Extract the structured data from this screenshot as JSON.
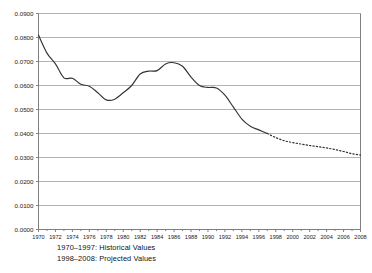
{
  "chart_data": {
    "type": "line",
    "title": "",
    "subtitle": "",
    "xlabel": "",
    "ylabel": "",
    "xlim": [
      1970,
      2008
    ],
    "ylim": [
      0.0,
      0.09
    ],
    "grid": true,
    "grid_axis": "y",
    "legend_position": "below-plot-left",
    "y_tick_labels": [
      "0.0900",
      "0.0800",
      "0.0700",
      "0.0600",
      "0.0500",
      "0.0400",
      "0.0300",
      "0.0200",
      "0.0100",
      "0.0000"
    ],
    "y_tick_values": [
      0.09,
      0.08,
      0.07,
      0.06,
      0.05,
      0.04,
      0.03,
      0.02,
      0.01,
      0.0
    ],
    "x_tick_labels": [
      "1970",
      "1972",
      "1974",
      "1976",
      "1978",
      "1980",
      "1982",
      "1984",
      "1986",
      "1988",
      "1990",
      "1992",
      "1994",
      "1996",
      "1998",
      "2000",
      "2002",
      "2004",
      "2006",
      "2008"
    ],
    "x_tick_values": [
      1970,
      1972,
      1974,
      1976,
      1978,
      1980,
      1982,
      1984,
      1986,
      1988,
      1990,
      1992,
      1994,
      1996,
      1998,
      2000,
      2002,
      2004,
      2006,
      2008
    ],
    "x": [
      1970,
      1971,
      1972,
      1973,
      1974,
      1975,
      1976,
      1977,
      1978,
      1979,
      1980,
      1981,
      1982,
      1983,
      1984,
      1985,
      1986,
      1987,
      1988,
      1989,
      1990,
      1991,
      1992,
      1993,
      1994,
      1995,
      1996,
      1997,
      1998,
      1999,
      2000,
      2001,
      2002,
      2003,
      2004,
      2005,
      2006,
      2007,
      2008
    ],
    "series": [
      {
        "name": "1970–1997: Historical Values",
        "style": "solid",
        "color": "#333333",
        "x": [
          1970,
          1971,
          1972,
          1973,
          1974,
          1975,
          1976,
          1977,
          1978,
          1979,
          1980,
          1981,
          1982,
          1983,
          1984,
          1985,
          1986,
          1987,
          1988,
          1989,
          1990,
          1991,
          1992,
          1993,
          1994,
          1995,
          1996,
          1997
        ],
        "values": [
          0.081,
          0.0735,
          0.069,
          0.0632,
          0.063,
          0.0605,
          0.0597,
          0.057,
          0.054,
          0.0543,
          0.057,
          0.06,
          0.0648,
          0.066,
          0.0662,
          0.069,
          0.0695,
          0.068,
          0.0635,
          0.06,
          0.0592,
          0.059,
          0.056,
          0.051,
          0.046,
          0.043,
          0.0415,
          0.04
        ]
      },
      {
        "name": "1998–2008: Projected Values",
        "style": "dotted",
        "color": "#333333",
        "x": [
          1997,
          1998,
          1999,
          2000,
          2001,
          2002,
          2003,
          2004,
          2005,
          2006,
          2007,
          2008
        ],
        "values": [
          0.04,
          0.0383,
          0.037,
          0.0362,
          0.0356,
          0.035,
          0.0345,
          0.034,
          0.0333,
          0.0325,
          0.0316,
          0.031
        ]
      }
    ],
    "annotations": []
  },
  "legend": {
    "line1": "1970–1997: Historical Values",
    "line2": "1998–2008: Projected Values"
  },
  "colors": {
    "line": "#333333",
    "grid": "#b3b3b3",
    "axis": "#808080",
    "text": "#1a1a1a",
    "background": "#ffffff"
  }
}
